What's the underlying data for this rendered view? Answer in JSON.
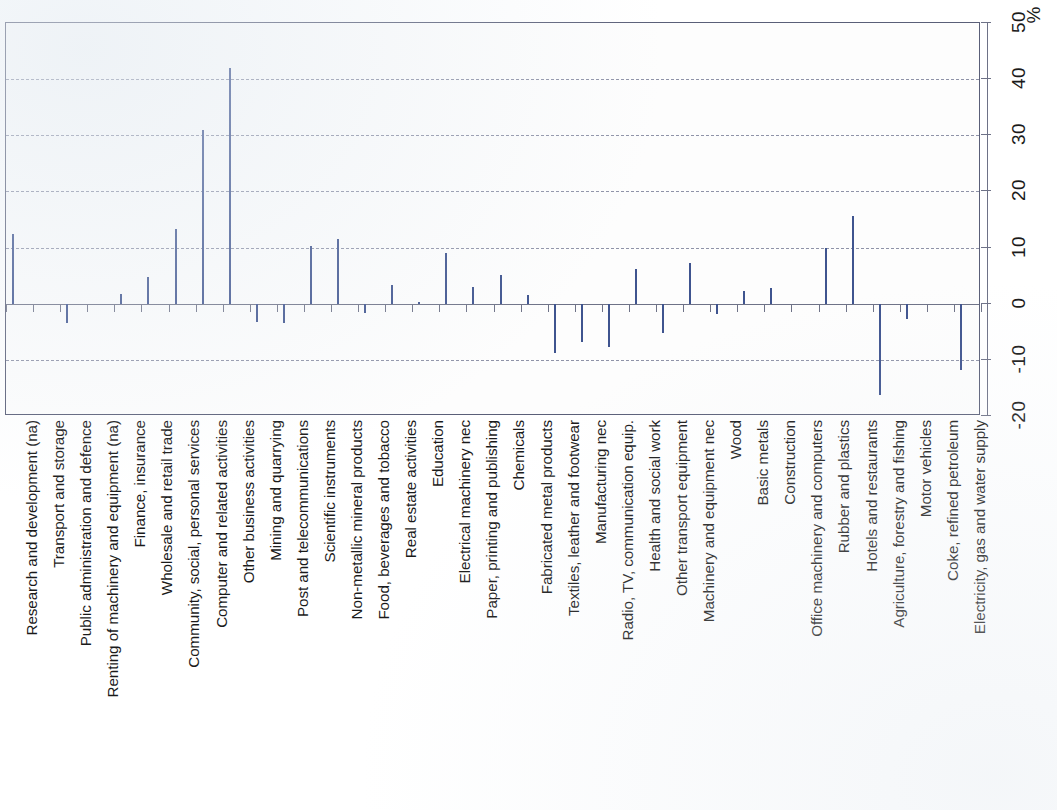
{
  "chart_data": {
    "type": "bar",
    "title": "",
    "subtitle": "",
    "xlabel": "",
    "ylabel": "%",
    "unit_label": "%",
    "orientation": "vertical-bars-rotated-page",
    "grid": true,
    "legend": "none",
    "ylim": [
      -20,
      50
    ],
    "ytick_labels": [
      "50",
      "40",
      "30",
      "20",
      "10",
      "0",
      "-10",
      "-20"
    ],
    "ytick_values": [
      50,
      40,
      30,
      20,
      10,
      0,
      -10,
      -20
    ],
    "gridline_values": [
      40,
      30,
      20,
      10,
      -10
    ],
    "zero_line_value": 0,
    "bar_color": "#5874b8",
    "bar_edge_color": "#3f548f",
    "grid_color": "#8f93a8",
    "axis_color": "#6e7287",
    "categories": [
      "Research and development (na)",
      "Transport and storage",
      "Public administration and defence",
      "Renting of machinery and equipment (na)",
      "Finance, insurance",
      "Wholesale and retail trade",
      "Community, social, personal services",
      "Computer and related activities",
      "Other business activities",
      "Mining and quarrying",
      "Post and telecommunications",
      "Scientific instruments",
      "Non-metallic mineral products",
      "Food, beverages and tobacco",
      "Real estate activities",
      "Education",
      "Electrical machinery nec",
      "Paper, printing and publishing",
      "Chemicals",
      "Fabricated metal products",
      "Textiles, leather and footwear",
      "Manufacturing nec",
      "Radio, TV, communication equip.",
      "Health and social work",
      "Other transport equipment",
      "Machinery and equipment nec",
      "Wood",
      "Basic metals",
      "Construction",
      "Office machinery and computers",
      "Rubber and plastics",
      "Hotels and restaurants",
      "Agriculture, forestry and fishing",
      "Motor vehicles",
      "Coke, refined petroleum",
      "Electricity, gas and water supply"
    ],
    "values": [
      12.5,
      0,
      -3.5,
      0,
      1.8,
      4.8,
      13.3,
      31.0,
      42.0,
      -3.2,
      -3.5,
      10.3,
      11.6,
      -1.6,
      3.4,
      0.3,
      9.1,
      3.0,
      5.2,
      1.6,
      -8.7,
      -6.8,
      -7.8,
      6.1,
      -5.2,
      7.3,
      -1.8,
      2.2,
      2.8,
      0.0,
      10.0,
      15.6,
      -16.2,
      -2.7,
      0.0,
      -11.8
    ]
  }
}
